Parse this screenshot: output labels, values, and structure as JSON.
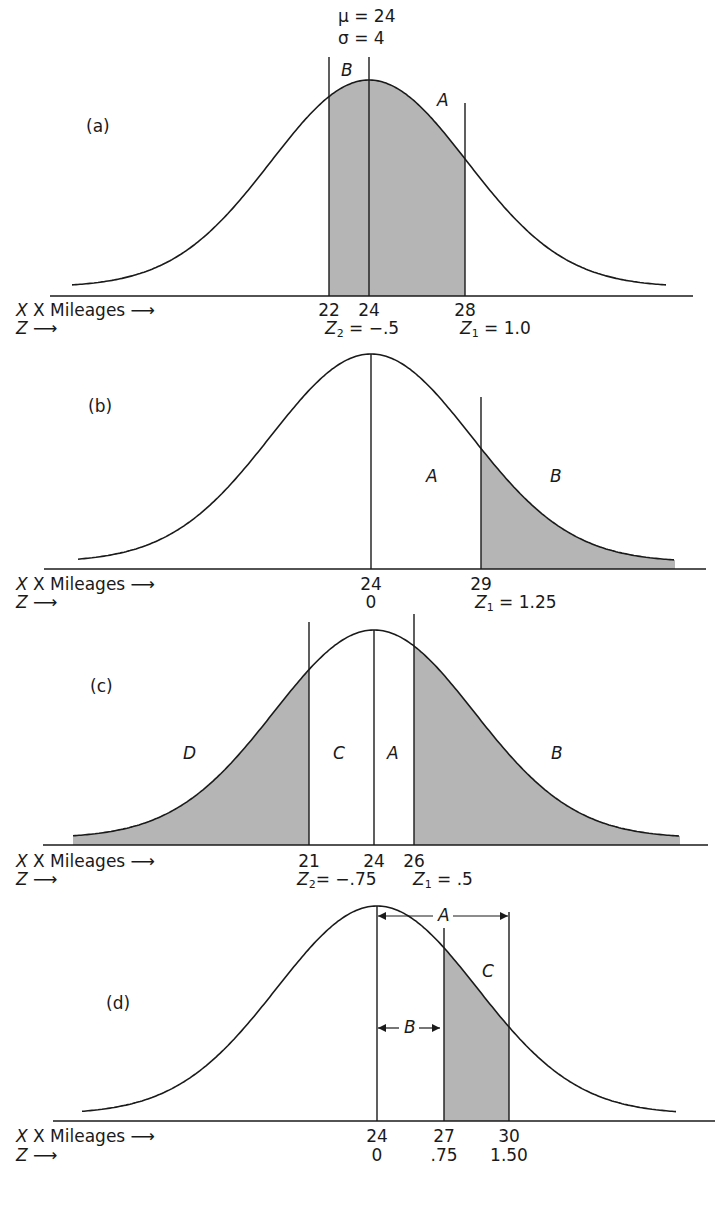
{
  "header": {
    "mu_label": "μ  =  24",
    "sigma_label": "σ  =  4"
  },
  "axis_labels": {
    "x": "X Mileages",
    "z": "Z",
    "arrow": "⟶"
  },
  "style": {
    "shade_color": "#b5b5b5",
    "line_color": "#1a1a1a"
  },
  "panels": [
    {
      "id": "a",
      "label": "(a)",
      "label_pos": [
        86,
        118
      ],
      "baseline_y": 296,
      "curve_base_y": 287,
      "peak_y": 80,
      "center_x": 369,
      "sigma_px": 98,
      "curve_x0": 72,
      "curve_x1": 667,
      "axis_x0": 50,
      "axis_x1": 693,
      "x_row_y": 302,
      "z_row_y": 320,
      "shaded": [
        [
          329,
          465
        ]
      ],
      "vlines": [
        {
          "x": 329,
          "top": 57
        },
        {
          "x": 369,
          "top": 57
        },
        {
          "x": 465,
          "top": 103
        }
      ],
      "regions": [
        {
          "text": "B",
          "x": 341,
          "y": 62
        },
        {
          "text": "A",
          "x": 437,
          "y": 92
        }
      ],
      "ticks": [
        {
          "x": 329,
          "X": "22",
          "Z": ""
        },
        {
          "x": 369,
          "X": "24",
          "Z": ""
        },
        {
          "x": 465,
          "X": "28",
          "Z": ""
        }
      ],
      "z_annotations": [
        {
          "x": 325,
          "sym": "Z",
          "sub": "2",
          "text": " = −.5"
        },
        {
          "x": 460,
          "sym": "Z",
          "sub": "1",
          "text": " = 1.0"
        }
      ]
    },
    {
      "id": "b",
      "label": "(b)",
      "label_pos": [
        88,
        398
      ],
      "baseline_y": 569,
      "curve_base_y": 562,
      "peak_y": 354,
      "center_x": 371,
      "sigma_px": 100,
      "curve_x0": 78,
      "curve_x1": 675,
      "axis_x0": 44,
      "axis_x1": 706,
      "x_row_y": 576,
      "z_row_y": 594,
      "shaded": [
        [
          481,
          675
        ]
      ],
      "vlines": [
        {
          "x": 371,
          "top": 354
        },
        {
          "x": 481,
          "top": 397
        }
      ],
      "regions": [
        {
          "text": "A",
          "x": 426,
          "y": 468
        },
        {
          "text": "B",
          "x": 550,
          "y": 468
        }
      ],
      "ticks": [
        {
          "x": 371,
          "X": "24",
          "Z": "0"
        },
        {
          "x": 481,
          "X": "29",
          "Z": ""
        }
      ],
      "z_annotations": [
        {
          "x": 475,
          "sym": "Z",
          "sub": "1",
          "text": " = 1.25"
        }
      ]
    },
    {
      "id": "c",
      "label": "(c)",
      "label_pos": [
        90,
        678
      ],
      "baseline_y": 845,
      "curve_base_y": 838,
      "peak_y": 630,
      "center_x": 374,
      "sigma_px": 100,
      "curve_x0": 73,
      "curve_x1": 680,
      "axis_x0": 43,
      "axis_x1": 708,
      "x_row_y": 853,
      "z_row_y": 871,
      "shaded": [
        [
          73,
          309
        ],
        [
          414,
          680
        ]
      ],
      "vlines": [
        {
          "x": 309,
          "top": 622
        },
        {
          "x": 374,
          "top": 630
        },
        {
          "x": 414,
          "top": 614
        }
      ],
      "regions": [
        {
          "text": "D",
          "x": 183,
          "y": 745
        },
        {
          "text": "C",
          "x": 333,
          "y": 745
        },
        {
          "text": "A",
          "x": 387,
          "y": 745
        },
        {
          "text": "B",
          "x": 551,
          "y": 745
        }
      ],
      "ticks": [
        {
          "x": 309,
          "X": "21",
          "Z": ""
        },
        {
          "x": 374,
          "X": "24",
          "Z": ""
        },
        {
          "x": 414,
          "X": "26",
          "Z": ""
        }
      ],
      "z_annotations": [
        {
          "x": 297,
          "sym": "Z",
          "sub": "2",
          "text": "= −.75"
        },
        {
          "x": 413,
          "sym": "Z",
          "sub": "1",
          "text": " = .5"
        }
      ]
    },
    {
      "id": "d",
      "label": "(d)",
      "label_pos": [
        106,
        995
      ],
      "baseline_y": 1121,
      "curve_base_y": 1114,
      "peak_y": 906,
      "center_x": 377,
      "sigma_px": 100,
      "curve_x0": 82,
      "curve_x1": 677,
      "axis_x0": 53,
      "axis_x1": 715,
      "x_row_y": 1128,
      "z_row_y": 1147,
      "shaded": [
        [
          444,
          509
        ]
      ],
      "vlines": [
        {
          "x": 377,
          "top": 906
        },
        {
          "x": 444,
          "top": 928
        },
        {
          "x": 509,
          "top": 912
        }
      ],
      "regions": [
        {
          "text": "C",
          "x": 482,
          "y": 963
        }
      ],
      "span_arrows": [
        {
          "label": "A",
          "x0": 377,
          "x1": 509,
          "y": 916
        },
        {
          "label": "B",
          "x0": 377,
          "x1": 441,
          "y": 1028
        }
      ],
      "ticks": [
        {
          "x": 377,
          "X": "24",
          "Z": "0"
        },
        {
          "x": 444,
          "X": "27",
          "Z": ".75"
        },
        {
          "x": 509,
          "X": "30",
          "Z": "1.50"
        }
      ],
      "z_annotations": []
    }
  ]
}
